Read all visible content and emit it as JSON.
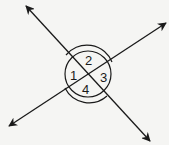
{
  "diagram": {
    "angles": [
      {
        "label": "1",
        "position": "left"
      },
      {
        "label": "2",
        "position": "top"
      },
      {
        "label": "3",
        "position": "right"
      },
      {
        "label": "4",
        "position": "bottom"
      }
    ],
    "colors": {
      "line": "#1a1a1a",
      "background": "#f5f5f3"
    }
  }
}
